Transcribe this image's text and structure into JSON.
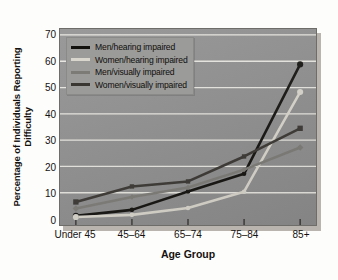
{
  "chart_data": {
    "type": "line",
    "title": "",
    "xlabel": "Age Group",
    "ylabel": "Percentage of Individuals Reporting Difficulty",
    "ylabel_lines": [
      "Percentage of Individuals Reporting",
      "Difficulty"
    ],
    "categories": [
      "Under 45",
      "45–64",
      "65–74",
      "75–84",
      "85+"
    ],
    "ylim": [
      0,
      70
    ],
    "yticks": [
      0,
      10,
      20,
      30,
      40,
      50,
      60,
      70
    ],
    "grid": "horizontal",
    "legend_position": "upper-left",
    "series": [
      {
        "name": "Men/hearing impaired",
        "color": "#14120f",
        "marker": "circle",
        "values": [
          1.2,
          3.5,
          10.5,
          17.2,
          58.8
        ]
      },
      {
        "name": "Women/hearing impaired",
        "color": "#d9d6cd",
        "marker": "circle",
        "values": [
          0.8,
          1.6,
          4.2,
          10.4,
          48.3
        ]
      },
      {
        "name": "Men/visually impaired",
        "color": "#7d7b76",
        "marker": "diamond",
        "values": [
          4.0,
          8.4,
          12.0,
          18.8,
          27.2
        ]
      },
      {
        "name": "Women/visually impaired",
        "color": "#3a3733",
        "marker": "square",
        "values": [
          6.5,
          12.4,
          14.3,
          23.8,
          34.5
        ]
      }
    ]
  },
  "axes": {
    "y_tick_labels": [
      "70",
      "60",
      "50",
      "40",
      "30",
      "20",
      "10",
      "0"
    ],
    "x_tick_labels": [
      "Under 45",
      "45–64",
      "65–74",
      "75–84",
      "85+"
    ]
  },
  "legend": {
    "entries": [
      {
        "label": "Men/hearing impaired",
        "color": "#14120f"
      },
      {
        "label": "Women/hearing impaired",
        "color": "#d9d6cd"
      },
      {
        "label": "Men/visually impaired",
        "color": "#7d7b76"
      },
      {
        "label": "Women/visually impaired",
        "color": "#3a3733"
      }
    ]
  },
  "style": {
    "plot_background": "#8e8e8e",
    "grid_color": "#e8e6e0",
    "figure_background": "#fdfdfc",
    "text_color": "#15120f"
  }
}
